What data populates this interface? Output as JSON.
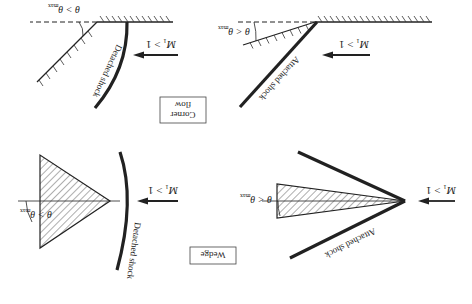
{
  "figure": {
    "orientation": "rotated-180",
    "panels": [
      {
        "id": "corner-detached",
        "mach_label": "M",
        "mach_sub": "1",
        "mach_rel": " > 1",
        "angle_label": "θ > θ",
        "angle_sub": "max",
        "shock_label": "Detached shock"
      },
      {
        "id": "corner-attached",
        "mach_label": "M",
        "mach_sub": "1",
        "mach_rel": " > 1",
        "angle_label": "θ < θ",
        "angle_sub": "max",
        "shock_label": "Attached shock"
      },
      {
        "id": "wedge-detached",
        "mach_label": "M",
        "mach_sub": "1",
        "mach_rel": " > 1",
        "angle_label": "θ > θ",
        "angle_sub": "max",
        "shock_label": "Detached shock"
      },
      {
        "id": "wedge-attached",
        "mach_label": "M",
        "mach_sub": "1",
        "mach_rel": " > 1",
        "angle_label": "θ < θ",
        "angle_sub": "max",
        "shock_label": "Attached shock"
      }
    ],
    "boxes": {
      "corner_line1": "Corner",
      "corner_line2": "flow",
      "wedge": "Wedge"
    }
  }
}
